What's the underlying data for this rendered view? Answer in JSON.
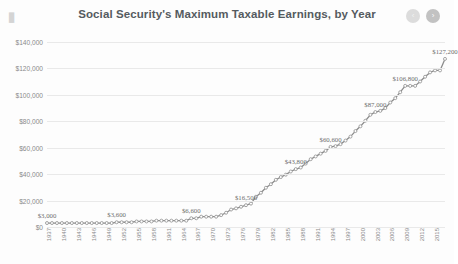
{
  "header": {
    "logo_icon": "presentation-icon",
    "title": "Social Security's Maximum Taxable Earnings, by Year",
    "prev_label": "‹",
    "next_label": "›"
  },
  "colors": {
    "line": "#8c8c8c",
    "marker": "#9a9a9a",
    "grid": "#e9e9e9",
    "title_text": "#555b60",
    "axis_text": "#8a8a8a",
    "label_text": "#6d6d6d",
    "background": "#fdfdfd"
  },
  "chart_data": {
    "type": "line",
    "title": "Social Security's Maximum Taxable Earnings, by Year",
    "xlabel": "",
    "ylabel": "",
    "ylim": [
      0,
      140000
    ],
    "ytick_labels": [
      "$0",
      "$20,000",
      "$40,000",
      "$60,000",
      "$80,000",
      "$100,000",
      "$120,000",
      "$140,000"
    ],
    "ytick_values": [
      0,
      20000,
      40000,
      60000,
      80000,
      100000,
      120000,
      140000
    ],
    "grid": true,
    "legend": false,
    "markers": true,
    "xtick_labels": [
      "1937",
      "1940",
      "1943",
      "1946",
      "1949",
      "1952",
      "1955",
      "1958",
      "1961",
      "1964",
      "1967",
      "1970",
      "1973",
      "1976",
      "1979",
      "1982",
      "1985",
      "1988",
      "1991",
      "1994",
      "1997",
      "2000",
      "2003",
      "2006",
      "2009",
      "2012",
      "2015"
    ],
    "x": [
      1937,
      1938,
      1939,
      1940,
      1941,
      1942,
      1943,
      1944,
      1945,
      1946,
      1947,
      1948,
      1949,
      1950,
      1951,
      1952,
      1953,
      1954,
      1955,
      1956,
      1957,
      1958,
      1959,
      1960,
      1961,
      1962,
      1963,
      1964,
      1965,
      1966,
      1967,
      1968,
      1969,
      1970,
      1971,
      1972,
      1973,
      1974,
      1975,
      1976,
      1977,
      1978,
      1979,
      1980,
      1981,
      1982,
      1983,
      1984,
      1985,
      1986,
      1987,
      1988,
      1989,
      1990,
      1991,
      1992,
      1993,
      1994,
      1995,
      1996,
      1997,
      1998,
      1999,
      2000,
      2001,
      2002,
      2003,
      2004,
      2005,
      2006,
      2007,
      2008,
      2009,
      2010,
      2011,
      2012,
      2013,
      2014,
      2015,
      2016,
      2017
    ],
    "values": [
      3000,
      3000,
      3000,
      3000,
      3000,
      3000,
      3000,
      3000,
      3000,
      3000,
      3000,
      3000,
      3000,
      3000,
      3600,
      3600,
      3600,
      3600,
      4200,
      4200,
      4200,
      4200,
      4800,
      4800,
      4800,
      4800,
      4800,
      4800,
      4800,
      6600,
      6600,
      7800,
      7800,
      7800,
      7800,
      9000,
      10800,
      13200,
      14100,
      15300,
      16500,
      17700,
      22900,
      25900,
      29700,
      32400,
      35700,
      37800,
      39600,
      42000,
      43800,
      45000,
      48000,
      51300,
      53400,
      55500,
      57600,
      60600,
      61200,
      62700,
      65400,
      68400,
      72600,
      76200,
      80400,
      84900,
      87000,
      87900,
      90000,
      94200,
      97500,
      102000,
      106800,
      106800,
      106800,
      110100,
      113700,
      117000,
      118500,
      118500,
      127200
    ],
    "data_labels": [
      {
        "year": 1937,
        "text": "$3,000"
      },
      {
        "year": 1951,
        "text": "$3,600"
      },
      {
        "year": 1966,
        "text": "$6,600"
      },
      {
        "year": 1977,
        "text": "$16,500"
      },
      {
        "year": 1987,
        "text": "$43,800"
      },
      {
        "year": 1994,
        "text": "$60,600"
      },
      {
        "year": 2003,
        "text": "$87,000"
      },
      {
        "year": 2009,
        "text": "$106,800"
      },
      {
        "year": 2017,
        "text": "$127,200"
      }
    ]
  }
}
